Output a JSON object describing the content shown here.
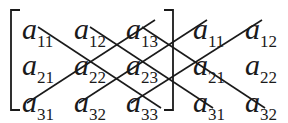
{
  "diagram": {
    "colors": {
      "ink": "#1a1a1a",
      "background": "#ffffff"
    },
    "matrix": {
      "rows": [
        [
          "a11",
          "a12",
          "a13"
        ],
        [
          "a21",
          "a22",
          "a23"
        ],
        [
          "a31",
          "a32",
          "a33"
        ]
      ]
    },
    "entries": [
      {
        "id": "a11",
        "base": "a",
        "sub": "11",
        "x": 22,
        "y": 14
      },
      {
        "id": "a12",
        "base": "a",
        "sub": "12",
        "x": 74,
        "y": 14
      },
      {
        "id": "a13",
        "base": "a",
        "sub": "13",
        "x": 126,
        "y": 14
      },
      {
        "id": "a21",
        "base": "a",
        "sub": "21",
        "x": 22,
        "y": 50
      },
      {
        "id": "a22",
        "base": "a",
        "sub": "22",
        "x": 74,
        "y": 50
      },
      {
        "id": "a23",
        "base": "a",
        "sub": "23",
        "x": 126,
        "y": 50
      },
      {
        "id": "a31",
        "base": "a",
        "sub": "31",
        "x": 22,
        "y": 87
      },
      {
        "id": "a32",
        "base": "a",
        "sub": "32",
        "x": 74,
        "y": 87
      },
      {
        "id": "a33",
        "base": "a",
        "sub": "33",
        "x": 126,
        "y": 87
      },
      {
        "id": "a11-rep",
        "base": "a",
        "sub": "11",
        "x": 193,
        "y": 14
      },
      {
        "id": "a12-rep",
        "base": "a",
        "sub": "12",
        "x": 245,
        "y": 14
      },
      {
        "id": "a21-rep",
        "base": "a",
        "sub": "21",
        "x": 193,
        "y": 50
      },
      {
        "id": "a22-rep",
        "base": "a",
        "sub": "22",
        "x": 245,
        "y": 50
      },
      {
        "id": "a31-rep",
        "base": "a",
        "sub": "31",
        "x": 193,
        "y": 87
      },
      {
        "id": "a32-rep",
        "base": "a",
        "sub": "32",
        "x": 245,
        "y": 87
      }
    ],
    "repeated_columns": [
      [
        "a11",
        "a21",
        "a31"
      ],
      [
        "a12",
        "a22",
        "a32"
      ]
    ],
    "diagonals_down": [
      {
        "from": "a11",
        "to": "a33",
        "x1": 38,
        "y1": 27,
        "x2": 161,
        "y2": 108
      },
      {
        "from": "a12",
        "to": "a31",
        "x1": 90,
        "y1": 27,
        "x2": 213,
        "y2": 108
      },
      {
        "from": "a13",
        "to": "a32",
        "x1": 142,
        "y1": 27,
        "x2": 265,
        "y2": 108
      }
    ],
    "diagonals_up": [
      {
        "from": "a31",
        "to": "a13",
        "x1": 27,
        "y1": 103,
        "x2": 155,
        "y2": 20
      },
      {
        "from": "a32",
        "to": "a11",
        "x1": 79,
        "y1": 103,
        "x2": 207,
        "y2": 20
      },
      {
        "from": "a33",
        "to": "a12",
        "x1": 131,
        "y1": 103,
        "x2": 262,
        "y2": 20
      }
    ],
    "brackets": {
      "left": {
        "x": 11,
        "top": 10,
        "bottom": 110,
        "tick": 9
      },
      "right": {
        "x": 173,
        "top": 10,
        "bottom": 110,
        "tick": 9
      }
    }
  }
}
